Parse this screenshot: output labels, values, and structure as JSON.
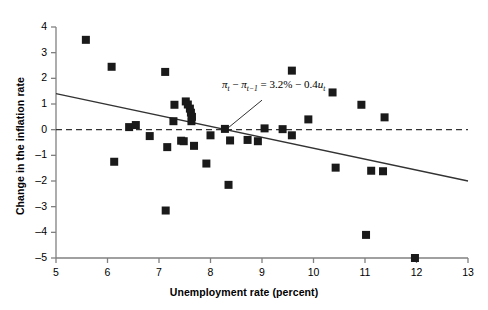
{
  "chart_data": {
    "type": "scatter",
    "title": "",
    "xlabel": "Unemployment rate (percent)",
    "ylabel": "Change in the inflation rate",
    "xlim": [
      5,
      13
    ],
    "ylim": [
      -5,
      4
    ],
    "xticks": [
      5,
      6,
      7,
      8,
      9,
      10,
      11,
      12,
      13
    ],
    "xtick_labels": [
      "5",
      "6",
      "7",
      "8",
      "9",
      "10",
      "11",
      "12",
      "13"
    ],
    "yticks": [
      4,
      3,
      2,
      1,
      0,
      -1,
      -2,
      -3,
      -4,
      -5
    ],
    "ytick_labels": [
      "4",
      "3",
      "2",
      "1",
      "0",
      "–1",
      "–2",
      "–3",
      "–4",
      "–5"
    ],
    "grid": false,
    "legend": null,
    "marker": "square",
    "marker_color": "#1a1a1a",
    "marker_size_px": 8,
    "points": [
      {
        "x": 5.58,
        "y": 3.5
      },
      {
        "x": 6.08,
        "y": 2.45
      },
      {
        "x": 7.12,
        "y": 2.25
      },
      {
        "x": 9.58,
        "y": 2.3
      },
      {
        "x": 10.37,
        "y": 1.45
      },
      {
        "x": 7.52,
        "y": 1.1
      },
      {
        "x": 7.56,
        "y": 0.98
      },
      {
        "x": 7.6,
        "y": 0.82
      },
      {
        "x": 7.62,
        "y": 0.66
      },
      {
        "x": 7.64,
        "y": 0.5
      },
      {
        "x": 7.63,
        "y": 0.33
      },
      {
        "x": 7.3,
        "y": 0.97
      },
      {
        "x": 10.93,
        "y": 0.97
      },
      {
        "x": 6.42,
        "y": 0.1
      },
      {
        "x": 6.55,
        "y": 0.18
      },
      {
        "x": 7.28,
        "y": 0.33
      },
      {
        "x": 9.9,
        "y": 0.4
      },
      {
        "x": 11.38,
        "y": 0.48
      },
      {
        "x": 8.28,
        "y": 0.03
      },
      {
        "x": 9.05,
        "y": 0.05
      },
      {
        "x": 9.4,
        "y": 0.02
      },
      {
        "x": 6.82,
        "y": -0.25
      },
      {
        "x": 8.0,
        "y": -0.22
      },
      {
        "x": 8.38,
        "y": -0.42
      },
      {
        "x": 8.72,
        "y": -0.4
      },
      {
        "x": 8.92,
        "y": -0.45
      },
      {
        "x": 9.58,
        "y": -0.22
      },
      {
        "x": 7.43,
        "y": -0.43
      },
      {
        "x": 7.48,
        "y": -0.45
      },
      {
        "x": 7.68,
        "y": -0.63
      },
      {
        "x": 7.16,
        "y": -0.68
      },
      {
        "x": 6.13,
        "y": -1.25
      },
      {
        "x": 7.92,
        "y": -1.32
      },
      {
        "x": 10.43,
        "y": -1.48
      },
      {
        "x": 11.12,
        "y": -1.6
      },
      {
        "x": 11.35,
        "y": -1.62
      },
      {
        "x": 8.35,
        "y": -2.15
      },
      {
        "x": 7.13,
        "y": -3.15
      },
      {
        "x": 11.02,
        "y": -4.1
      },
      {
        "x": 11.97,
        "y": -5.0
      }
    ],
    "regression_line": {
      "intercept": 3.2,
      "slope": -0.4,
      "x_start": 5,
      "y_start": 1.4,
      "x_end": 13,
      "y_end": -2.0,
      "color": "#333333"
    },
    "zero_line": {
      "y": 0,
      "style": "dashed",
      "color": "#333333"
    },
    "annotation": {
      "equation_plain": "πt − πt−1 = 3.2% − 0.4ut",
      "pi": "π",
      "sub_t": "t",
      "sub_t_minus_1": "t−1",
      "minus": "−",
      "equals": "=",
      "intercept_text": "3.2%",
      "slope_text": "0.4",
      "u": "u",
      "leader_line": {
        "x1": 8.3,
        "y1": 0.0,
        "x2": 9.0,
        "y2": 1.15
      }
    }
  }
}
